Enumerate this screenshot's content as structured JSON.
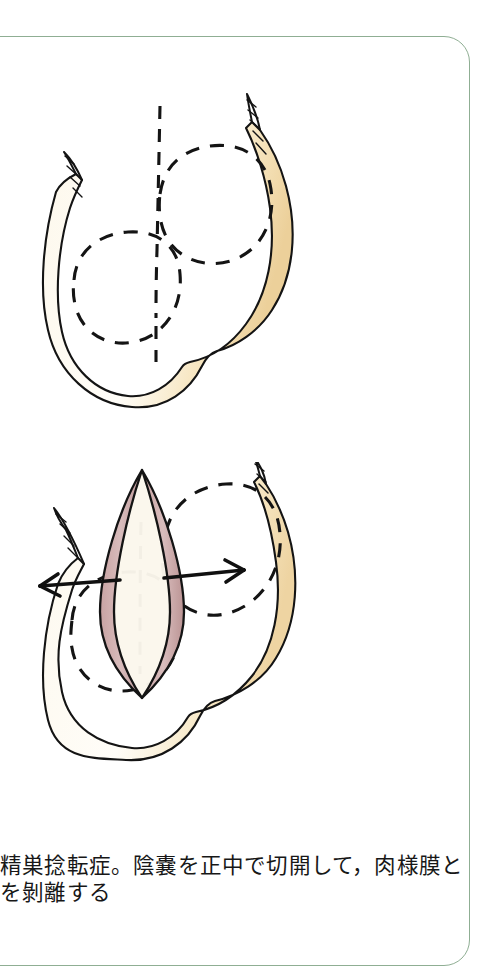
{
  "page": {
    "background_color": "#ffffff",
    "frame_color": "#8fae93",
    "language": "ja"
  },
  "palette": {
    "ink": "#1a1a1a",
    "skin_fill": "#fdf6e3",
    "skin_shade": "#f2dcae",
    "skin_shade_deep": "#e9c98c",
    "incision_edge": "#c9a7a7",
    "incision_edge_dark": "#b08c8c",
    "incision_interior": "#fbf7ec",
    "dashed_ink": "#151515",
    "frame_green": "#8fae93"
  },
  "figures": [
    {
      "id": "figure-top",
      "name": "scrotum-intact-with-planned-incision",
      "caption_role": "upper-illustration",
      "description": "Intact scrotum drawn in outline with pale skin shading; both testes indicated by dashed outlines and a vertical dashed midline marking the planned median raphe incision.",
      "elements": [
        "scrotum-outline",
        "left-spermatic-cord-stub",
        "right-spermatic-cord-stub",
        "dashed-midline-incision-marker",
        "dashed-left-testis-outline",
        "dashed-right-testis-outline"
      ]
    },
    {
      "id": "figure-bottom",
      "name": "scrotum-opened-median-incision",
      "caption_role": "lower-illustration",
      "description": "Same scrotum after a median incision; the lenticular opening is retracted showing pink cut tissue edges, with paired horizontal arrows pointing left and right to indicate blunt dissection of the dartos layer away from the incision.",
      "elements": [
        "scrotum-outline",
        "incision-opening",
        "incision-edge-left",
        "incision-edge-right",
        "dissection-arrow-left",
        "dissection-arrow-right",
        "dashed-left-testis-outline",
        "dashed-right-testis-outline",
        "dashed-midline-marker"
      ],
      "arrows": [
        {
          "name": "dissection-arrow-left",
          "direction": "left"
        },
        {
          "name": "dissection-arrow-right",
          "direction": "right"
        }
      ]
    }
  ],
  "caption": {
    "line1": "精巣捻転症。陰嚢を正中で切開して，肉様膜と",
    "line2": "を剝離する"
  }
}
